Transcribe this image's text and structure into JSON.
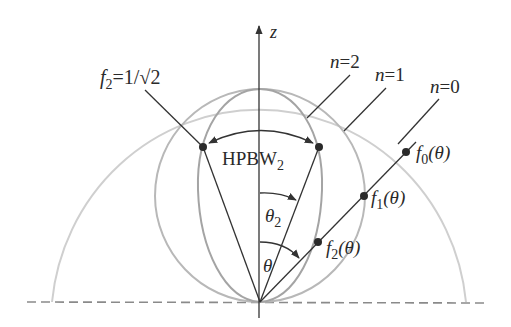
{
  "figure": {
    "type": "polar radiation pattern diagram",
    "axis_label": "z",
    "labels": {
      "half_power": "f",
      "half_power_sub": "2",
      "half_power_value": "=1/√2",
      "hpbw": "HPBW",
      "hpbw_sub": "2",
      "theta2": "θ",
      "theta2_sub": "2",
      "theta": "θ",
      "n2": "n=2",
      "n1": "n=1",
      "n0": "n=0",
      "f0": "f",
      "f0_sub": "0",
      "f0_arg": "(θ)",
      "f1": "f",
      "f1_sub": "1",
      "f1_arg": "(θ)",
      "f2": "f",
      "f2_sub": "2",
      "f2_arg": "(θ)"
    },
    "curves": [
      {
        "name": "n=0",
        "pattern": "f0(θ) = 1 (semicircle)",
        "color": "#c8c8c8"
      },
      {
        "name": "n=1",
        "pattern": "f1(θ) = cos θ",
        "color": "#b4b4b4"
      },
      {
        "name": "n=2",
        "pattern": "f2(θ) = cos² θ",
        "color": "#a0a0a0"
      }
    ],
    "colors": {
      "line": "#333333",
      "dots": "#2a2a2a",
      "baseline_dash": "#8a8a8a"
    }
  }
}
